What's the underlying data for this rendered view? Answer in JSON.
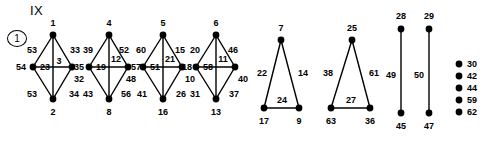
{
  "plate": {
    "title": "IX",
    "figure_number": "1"
  },
  "graph_data": {
    "type": "diagram",
    "description": "Graph decomposition plate: four diamond graphs, two triangles, two single edges, five isolated vertices",
    "components": [
      {
        "kind": "diamond",
        "vertices": {
          "top": "1",
          "left": "54",
          "right": "32",
          "bottom": "2"
        },
        "edges": {
          "top_left": "53",
          "top_right": "33",
          "horizontal_left": "23",
          "vertical": "3",
          "bottom_left": "53",
          "bottom_right": "34"
        }
      },
      {
        "kind": "diamond",
        "vertices": {
          "top": "4",
          "left": "35",
          "right": "57",
          "bottom": "8"
        },
        "edges": {
          "top_left": "39",
          "top_right": "52",
          "horizontal_left": "19",
          "vertical": "12",
          "bottom_left": "43",
          "bottom_right": "56",
          "extra_right": "48"
        }
      },
      {
        "kind": "diamond",
        "vertices": {
          "top": "5",
          "left": "",
          "right": "10",
          "bottom": "16"
        },
        "edges": {
          "top_left": "60",
          "top_right": "15",
          "horizontal_left": "51",
          "vertical": "21",
          "bottom_left": "41",
          "bottom_right": "26"
        }
      },
      {
        "kind": "diamond",
        "vertices": {
          "top": "6",
          "left": "18",
          "right": "40",
          "bottom": "13"
        },
        "edges": {
          "top_left": "20",
          "top_right": "46",
          "horizontal_left": "58",
          "vertical": "11",
          "bottom_left": "31",
          "bottom_right": "37"
        }
      },
      {
        "kind": "triangle",
        "vertices": {
          "apex": "7",
          "left": "17",
          "right": "9"
        },
        "edges": {
          "left": "22",
          "right": "14",
          "base": "24"
        }
      },
      {
        "kind": "triangle",
        "vertices": {
          "apex": "25",
          "left": "63",
          "right": "36"
        },
        "edges": {
          "left": "38",
          "right": "61",
          "base": "27"
        }
      },
      {
        "kind": "edge",
        "vertices": {
          "top": "28",
          "bottom": "45"
        },
        "edges": {
          "segment": "49"
        }
      },
      {
        "kind": "edge",
        "vertices": {
          "top": "29",
          "bottom": "47"
        },
        "edges": {
          "segment": "50"
        }
      }
    ],
    "isolated_vertices": [
      "30",
      "42",
      "44",
      "59",
      "62"
    ]
  },
  "g1": {
    "v_top": "1",
    "v_left": "54",
    "v_right": "32",
    "v_bottom": "2",
    "e_tl": "53",
    "e_tr": "33",
    "e_hl": "23",
    "e_v": "3",
    "e_bl": "53",
    "e_br": "34"
  },
  "g2": {
    "v_top": "4",
    "v_left": "35",
    "v_right": "57",
    "v_bottom": "8",
    "e_tl": "39",
    "e_tr": "52",
    "e_hl": "19",
    "e_v": "12",
    "e_bl": "43",
    "e_br": "56",
    "e_xr": "48"
  },
  "g3": {
    "v_top": "5",
    "v_right": "10",
    "v_bottom": "16",
    "e_tl": "60",
    "e_tr": "15",
    "e_hl": "51",
    "e_v": "21",
    "e_bl": "41",
    "e_br": "26"
  },
  "g4": {
    "v_top": "6",
    "v_left": "18",
    "v_right": "40",
    "v_bottom": "13",
    "e_tl": "20",
    "e_tr": "46",
    "e_hl": "58",
    "e_v": "11",
    "e_bl": "31",
    "e_br": "37"
  },
  "t1": {
    "v_apex": "7",
    "v_left": "17",
    "v_right": "9",
    "e_left": "22",
    "e_right": "14",
    "e_base": "24"
  },
  "t2": {
    "v_apex": "25",
    "v_left": "63",
    "v_right": "36",
    "e_left": "38",
    "e_right": "61",
    "e_base": "27"
  },
  "s1": {
    "v_top": "28",
    "v_bottom": "45",
    "e_seg": "49"
  },
  "s2": {
    "v_top": "29",
    "v_bottom": "47",
    "e_seg": "50"
  },
  "isolated": {
    "i0": "30",
    "i1": "42",
    "i2": "44",
    "i3": "59",
    "i4": "62"
  }
}
